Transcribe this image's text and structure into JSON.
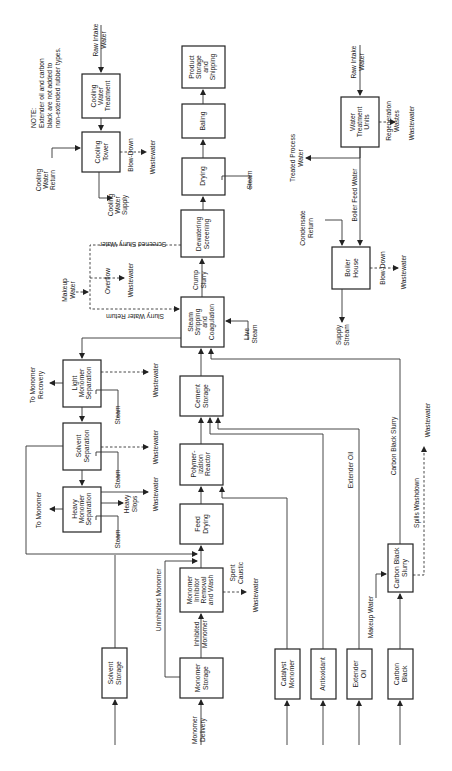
{
  "diagram": {
    "orientation": "rotated 90 degrees counter-clockwise",
    "note": {
      "l1": "NOTE:",
      "l2": "Extender oil and carbon",
      "l3": "black are not added to",
      "l4": "non-extended rubber types."
    },
    "boxes": {
      "solvent_storage": [
        "Solvent",
        "Storage"
      ],
      "monomer_storage": [
        "Monomer",
        "Storage"
      ],
      "inhibitor_removal": [
        "Monomer",
        "Inhibitor",
        "Removal",
        "and Wash"
      ],
      "feed_drying": [
        "Feed",
        "Drying"
      ],
      "polymerization_reactor": [
        "Polymer-",
        "ization",
        "Reactor"
      ],
      "cement_storage": [
        "Cement",
        "Storage"
      ],
      "steam_stripping": [
        "Steam",
        "Stripping",
        "and",
        "Coagulation"
      ],
      "dewatering": [
        "Dewatering",
        "Screening"
      ],
      "drying": [
        "Drying"
      ],
      "baling": [
        "Baling"
      ],
      "product_storage": [
        "Product",
        "Storage",
        "and",
        "Shipping"
      ],
      "heavy_monomer_sep": [
        "Heavy",
        "Monomer",
        "Separation"
      ],
      "solvent_sep": [
        "Solvent",
        "Separation"
      ],
      "light_monomer_sep": [
        "Light",
        "Monomer",
        "Separation"
      ],
      "catalyst_monomer": [
        "Catalyst",
        "Monomer"
      ],
      "antioxidant": [
        "Antioxidant"
      ],
      "extender_oil_box": [
        "Extender",
        "Oil"
      ],
      "carbon_black": [
        "Carbon",
        "Black"
      ],
      "carbon_black_slurry": [
        "Carbon Black",
        "Slurry"
      ],
      "cooling_tower": [
        "Cooling",
        "Tower"
      ],
      "cooling_water_treatment": [
        "Cooling",
        "Water",
        "Treatment"
      ],
      "boiler_house": [
        "Boiler",
        "House"
      ],
      "water_treatment": [
        "Water",
        "Treatment",
        "Units"
      ]
    },
    "labels": {
      "monomer_delivery": [
        "Monomer",
        "Delivery"
      ],
      "inhibited_monomer": [
        "Inhibited",
        "Monomer"
      ],
      "uninhibited_monomer": "Uninhibited Monomer",
      "spent_caustic": [
        "Spent",
        "Caustic"
      ],
      "wastewater": "Wastewater",
      "to_monomer": "To Monomer",
      "to_monomer_recovery": [
        "To Monomer",
        "Recovery"
      ],
      "heavy_slops": [
        "Heavy",
        "Slops"
      ],
      "steam": "Steam",
      "live_steam": [
        "Live",
        "Steam"
      ],
      "crump_slurry": [
        "Crump",
        "Slurry"
      ],
      "screened_slurry_water": "Screened Slurry Water",
      "slurry_water_return": "Slurry Water Return",
      "makeup_water": [
        "Makeup",
        "Water"
      ],
      "overflow": "Overflow",
      "extender_oil": "Extender Oil",
      "carbon_black_slurry_line": "Carbon Black Slurry",
      "spills_washdown": "Spills Washdown",
      "makeup_water_line": "Makeup Water",
      "cooling_water_return": [
        "Cooling",
        "Water",
        "Return"
      ],
      "cooling_water_supply": [
        "Cooling",
        "Water",
        "Supply"
      ],
      "blow_down": "Blow-Down",
      "raw_intake_water": [
        "Raw Intake",
        "Water"
      ],
      "treated_process_water": [
        "Treated Process",
        "Water"
      ],
      "boiler_feed_water": "Boiler Feed Water",
      "condensate_return": [
        "Condensate",
        "Return"
      ],
      "supply_stream": [
        "Supply",
        "Stream"
      ],
      "regeneration_wastes": [
        "Regeneration",
        "Wastes"
      ]
    }
  }
}
